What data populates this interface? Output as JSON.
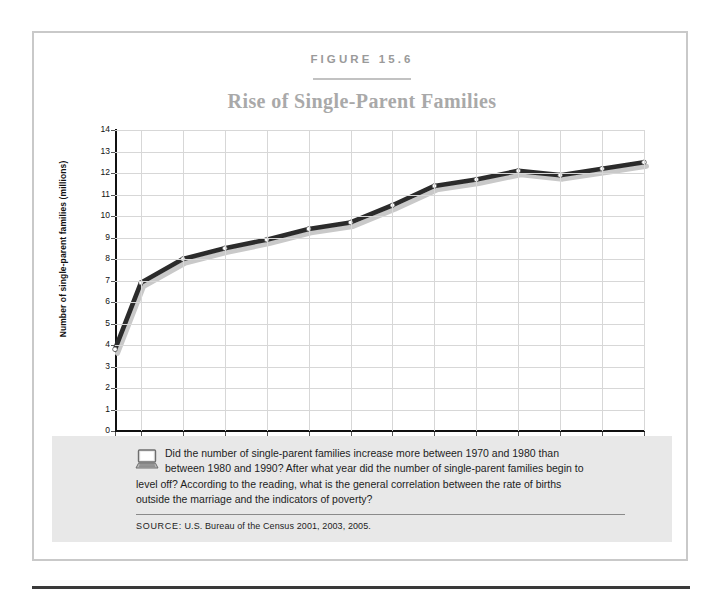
{
  "figure": {
    "label": "FIGURE 15.6",
    "title": "Rise of Single-Parent Families"
  },
  "caption": {
    "icon": "laptop-icon",
    "line1": "Did the number of single-parent families increase more between 1970 and 1980 than",
    "line2": "between 1980 and 1990? After what year did the number of single-parent families begin to",
    "line3": "level off? According to the reading, what is the general correlation between the rate of births",
    "line4": "outside the marriage and the indicators of poverty?",
    "source_keyword": "SOURCE:",
    "source_text": " U.S. Bureau of the Census 2001, 2003, 2005."
  },
  "colors": {
    "line": "#2b2b2b",
    "shadow": "#c9c9c9",
    "marker_fill": "#ffffff",
    "grid": "#d7d7d7",
    "axis": "#111111",
    "title": "#a9a9a9",
    "band": "#e8e8e8",
    "card_border": "#c9c9c9"
  },
  "chart_data": {
    "type": "line",
    "title": "Rise of Single-Parent Families",
    "xlabel": "",
    "ylabel": "Number of single-parent families (millions)",
    "xlim": [
      1970,
      2004
    ],
    "ylim": [
      0,
      14
    ],
    "grid": true,
    "legend": null,
    "ytick_labels": [
      "0",
      "1",
      "2",
      "3",
      "4",
      "5",
      "6",
      "7",
      "8",
      "9",
      "10",
      "11",
      "12",
      "13",
      "14"
    ],
    "yticks": [
      0,
      1,
      2,
      3,
      4,
      5,
      6,
      7,
      8,
      9,
      10,
      11,
      12,
      13,
      14
    ],
    "xtick_labels": [
      "1970",
      "1980",
      "1982",
      "1984",
      "1986",
      "1988",
      "1990",
      "1992",
      "1994",
      "1996",
      "1998",
      "2000",
      "2002",
      "2004"
    ],
    "xticks": [
      1970,
      1980,
      1982,
      1984,
      1986,
      1988,
      1990,
      1992,
      1994,
      1996,
      1998,
      2000,
      2002,
      2004
    ],
    "x": [
      1970,
      1980,
      1982,
      1984,
      1986,
      1988,
      1990,
      1992,
      1994,
      1996,
      1998,
      2000,
      2002,
      2004
    ],
    "values": [
      3.8,
      6.9,
      8.0,
      8.5,
      8.9,
      9.4,
      9.7,
      10.5,
      11.4,
      11.7,
      12.1,
      11.9,
      12.2,
      12.5
    ],
    "series": [
      {
        "name": "Single-parent families (millions)",
        "values": [
          3.8,
          6.9,
          8.0,
          8.5,
          8.9,
          9.4,
          9.7,
          10.5,
          11.4,
          11.7,
          12.1,
          11.9,
          12.2,
          12.5
        ]
      }
    ]
  }
}
